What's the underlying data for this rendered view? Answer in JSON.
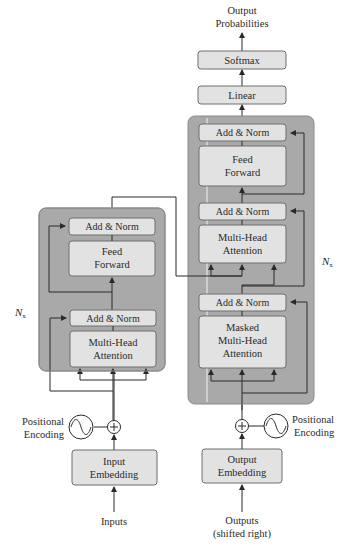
{
  "colors": {
    "block_bg": "#a9a9a9",
    "block_border": "#8a8a8a",
    "module_bg": "#e2e2e2",
    "module_border": "#6e6e6e",
    "line": "#2a2a2a",
    "text": "#2a2a2a"
  },
  "top_label": {
    "line1": "Output",
    "line2": "Probabilities"
  },
  "head": {
    "softmax": "Softmax",
    "linear": "Linear"
  },
  "encoder": {
    "repeat_label": "N",
    "repeat_sub": "x",
    "add_norm_top": "Add & Norm",
    "feed_forward": {
      "line1": "Feed",
      "line2": "Forward"
    },
    "add_norm_bottom": "Add & Norm",
    "attention": {
      "line1": "Multi-Head",
      "line2": "Attention"
    },
    "positional_encoding": {
      "line1": "Positional",
      "line2": "Encoding"
    },
    "embedding": {
      "line1": "Input",
      "line2": "Embedding"
    },
    "input_label": "Inputs"
  },
  "decoder": {
    "repeat_label": "N",
    "repeat_sub": "x",
    "add_norm_top": "Add & Norm",
    "feed_forward": {
      "line1": "Feed",
      "line2": "Forward"
    },
    "add_norm_middle": "Add & Norm",
    "cross_attention": {
      "line1": "Multi-Head",
      "line2": "Attention"
    },
    "add_norm_bottom": "Add & Norm",
    "masked_attention": {
      "line1": "Masked",
      "line2": "Multi-Head",
      "line3": "Attention"
    },
    "positional_encoding": {
      "line1": "Positional",
      "line2": "Encoding"
    },
    "embedding": {
      "line1": "Output",
      "line2": "Embedding"
    },
    "input_label": {
      "line1": "Outputs",
      "line2": "(shifted right)"
    }
  }
}
